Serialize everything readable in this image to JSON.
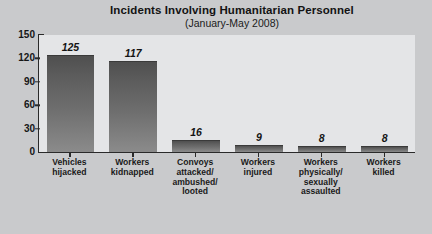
{
  "chart_data": {
    "type": "bar",
    "title": "Incidents Involving Humanitarian Personnel",
    "subtitle": "(January-May 2008)",
    "xlabel": "",
    "ylabel": "",
    "ylim": [
      0,
      150
    ],
    "grid": false,
    "legend": null,
    "yticks": [
      0,
      30,
      60,
      90,
      120,
      150
    ],
    "ytick_labels": [
      "0",
      "30",
      "60",
      "90",
      "120",
      "150"
    ],
    "categories": [
      "Vehicles\nhijacked",
      "Workers\nkidnapped",
      "Convoys\nattacked/\nambushed/\nlooted",
      "Workers\ninjured",
      "Workers\nphysically/\nsexually\nassaulted",
      "Workers\nkilled"
    ],
    "values": [
      125,
      117,
      16,
      9,
      8,
      8
    ],
    "value_labels": [
      "125",
      "117",
      "16",
      "9",
      "8",
      "8"
    ],
    "bar_color_top": "#4f4f4f",
    "bar_color_bottom": "#8b8b8b",
    "background_color": "#c9cacc",
    "plot_background_color": "#e4e5e7",
    "axis_color": "#2a2a2a"
  },
  "footer": {
    "cutoff_text": ""
  }
}
